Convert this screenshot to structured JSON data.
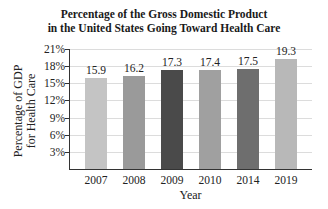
{
  "chart_data": {
    "type": "bar",
    "title": "Percentage of the Gross Domestic Product in the United States Going Toward Health Care",
    "title_lines": [
      "Percentage of the Gross Domestic Product",
      "in the United States Going Toward Health Care"
    ],
    "xlabel": "Year",
    "ylabel": "Percentage of GDP for Health Care",
    "ylabel_lines": [
      "Percentage of GDP",
      "for Health Care"
    ],
    "categories": [
      "2007",
      "2008",
      "2009",
      "2010",
      "2014",
      "2019"
    ],
    "values": [
      15.9,
      16.2,
      17.3,
      17.4,
      17.5,
      19.3
    ],
    "value_labels": [
      "15.9",
      "16.2",
      "17.3",
      "17.4",
      "17.5",
      "19.3"
    ],
    "bar_colors": [
      "#c4c4c4",
      "#9a9a9a",
      "#4a4a4a",
      "#a0a0a0",
      "#6e6e6e",
      "#b8b8b8"
    ],
    "yticks": [
      3,
      6,
      9,
      12,
      15,
      18,
      21
    ],
    "ytick_labels": [
      "3%",
      "6%",
      "9%",
      "12%",
      "15%",
      "18%",
      "21%"
    ],
    "ylim": [
      0,
      21
    ],
    "grid": true,
    "legend": null
  }
}
